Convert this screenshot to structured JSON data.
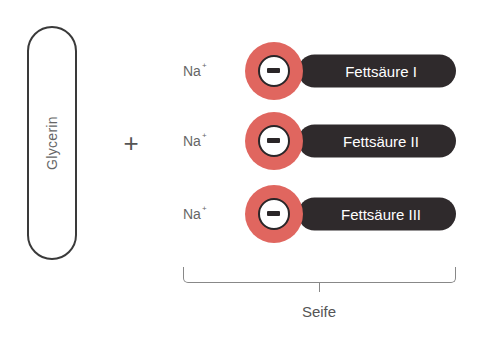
{
  "diagram": {
    "glycerin": {
      "label": "Glycerin"
    },
    "operator": "+",
    "rows": [
      {
        "cation": "Na",
        "charge": "+",
        "anion_sign": "−",
        "chain": "Fettsäure I"
      },
      {
        "cation": "Na",
        "charge": "+",
        "anion_sign": "−",
        "chain": "Fettsäure II"
      },
      {
        "cation": "Na",
        "charge": "+",
        "anion_sign": "−",
        "chain": "Fettsäure III"
      }
    ],
    "bracket_label": "Seife"
  },
  "colors": {
    "anion_head": "#e0665f",
    "chain_body": "#2f2a2c",
    "outline": "#3a3a3a",
    "text": "#555555"
  }
}
